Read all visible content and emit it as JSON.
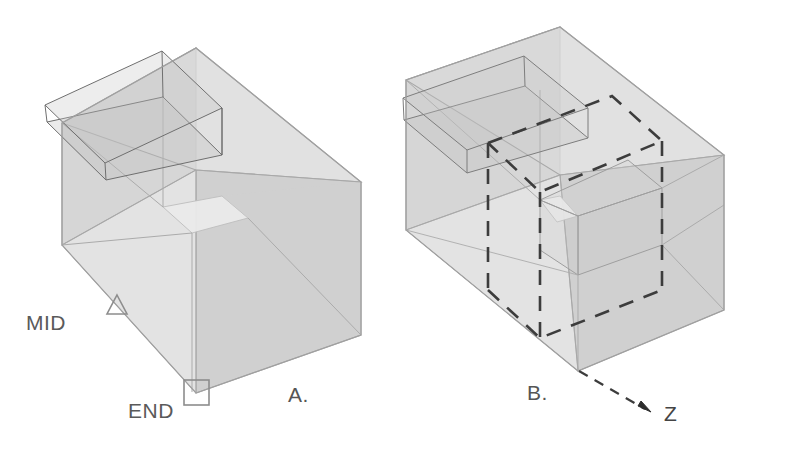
{
  "figure": {
    "background_color": "#ffffff",
    "panels": [
      {
        "id": "panel-a",
        "label": "A.",
        "label_pos": {
          "x": 288,
          "y": 402
        },
        "markers": [
          {
            "name": "mid-marker",
            "glyph": "triangle",
            "label": "MID",
            "label_pos": {
              "x": 26,
              "y": 330
            },
            "marker_pos": {
              "x": 117,
              "y": 307
            }
          },
          {
            "name": "end-marker",
            "glyph": "square",
            "label": "END",
            "label_pos": {
              "x": 128,
              "y": 418
            },
            "marker_pos": {
              "x": 196,
              "y": 393
            }
          }
        ]
      },
      {
        "id": "panel-b",
        "label": "B.",
        "label_pos": {
          "x": 527,
          "y": 400
        },
        "axis": {
          "name": "z-axis",
          "label": "Z",
          "label_pos": {
            "x": 664,
            "y": 421
          },
          "arrow_tip": {
            "x": 648,
            "y": 411
          },
          "arrow_origin": {
            "x": 579,
            "y": 371
          },
          "style": "dashed"
        }
      }
    ],
    "colors": {
      "face_top": "#d8d8d8",
      "face_left": "#c9c9c9",
      "face_right": "#cccccc",
      "face_inner_light": "#e8e8e8",
      "edge": "#9a9a9a",
      "edge_dark": "#6f6f6f",
      "dashed_edge": "#3c3c3c",
      "marker_stroke": "#8a8a8a",
      "text": "#555555"
    },
    "caption_items": [
      "MID",
      "END",
      "A.",
      "B.",
      "Z"
    ]
  }
}
